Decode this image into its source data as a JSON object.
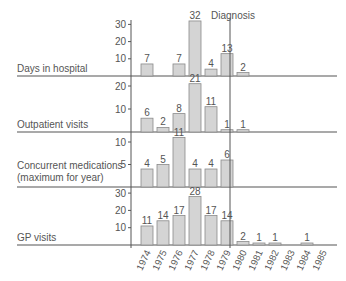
{
  "chart_data": {
    "type": "bar",
    "layout": "stacked-panels",
    "categories": [
      "1974",
      "1975",
      "1976",
      "1977",
      "1978",
      "1979",
      "1980",
      "1981",
      "1982",
      "1983",
      "1984",
      "1985"
    ],
    "annotation": {
      "label": "Diagnosis",
      "position": "1979"
    },
    "colors": {
      "bar_fill": "#d4d4d4",
      "bar_stroke": "#8a8a8a",
      "axis": "#555555",
      "text": "#555555"
    },
    "grid": false,
    "panels": [
      {
        "name": "Days in hospital",
        "label_lines": [
          "Days in hospital"
        ],
        "ticks": [
          10,
          20,
          30
        ],
        "ylim": [
          0,
          32
        ],
        "values": [
          7,
          null,
          7,
          32,
          4,
          13,
          2,
          null,
          null,
          null,
          null,
          null
        ]
      },
      {
        "name": "Outpatient visits",
        "label_lines": [
          "Outpatient visits"
        ],
        "ticks": [
          10,
          20
        ],
        "ylim": [
          0,
          21
        ],
        "values": [
          6,
          2,
          8,
          21,
          11,
          1,
          1,
          null,
          null,
          null,
          null,
          null
        ]
      },
      {
        "name": "Concurrent medications (maximum for year)",
        "label_lines": [
          "Concurrent medications",
          "(maximum for year)"
        ],
        "ticks": [
          5,
          10
        ],
        "ylim": [
          0,
          11
        ],
        "values": [
          4,
          5,
          11,
          4,
          4,
          6,
          null,
          null,
          null,
          null,
          null,
          null
        ]
      },
      {
        "name": "GP visits",
        "label_lines": [
          "GP visits"
        ],
        "ticks": [
          10,
          20,
          30
        ],
        "ylim": [
          0,
          30
        ],
        "values": [
          11,
          14,
          17,
          28,
          17,
          14,
          2,
          1,
          1,
          null,
          1,
          null
        ]
      }
    ]
  }
}
